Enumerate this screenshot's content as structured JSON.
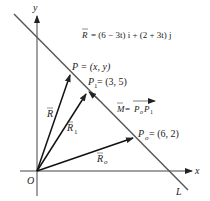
{
  "diagram": {
    "axes": {
      "x_label": "x",
      "y_label": "y",
      "origin_label": "O"
    },
    "line_label": "L",
    "equation": {
      "lhs": "R",
      "rhs": "= (6 − 3t) i + (2 + 3t) j"
    },
    "points": {
      "P": {
        "label": "P = (x, y)"
      },
      "P1": {
        "label_main": "P",
        "label_sub": "1",
        "label_rest": " = (3, 5)"
      },
      "Po": {
        "label_main": "P",
        "label_sub": "o",
        "label_rest": " = (6, 2)"
      }
    },
    "vectors": {
      "R": {
        "label": "R"
      },
      "R1": {
        "label_main": "R",
        "label_sub": "1"
      },
      "Ro": {
        "label_main": "R",
        "label_sub": "o"
      }
    },
    "direction": {
      "lhs": "M",
      "eq": " = ",
      "p0": "P",
      "p0_sub": "o",
      "p1": "P",
      "p1_sub": "1"
    }
  }
}
